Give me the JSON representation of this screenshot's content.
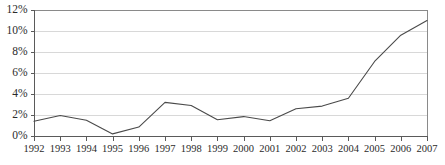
{
  "chart_data": {
    "type": "line",
    "title": "",
    "subtitle": "",
    "xlabel": "",
    "ylabel": "",
    "categories": [
      "1992",
      "1993",
      "1994",
      "1995",
      "1996",
      "1997",
      "1998",
      "1999",
      "2000",
      "2001",
      "2002",
      "2003",
      "2004",
      "2005",
      "2006",
      "2007"
    ],
    "x": [
      1992,
      1993,
      1994,
      1995,
      1996,
      1997,
      1998,
      1999,
      2000,
      2001,
      2002,
      2003,
      2004,
      2005,
      2006,
      2007
    ],
    "values": [
      1.4,
      1.95,
      1.5,
      0.2,
      0.85,
      3.2,
      2.9,
      1.55,
      1.85,
      1.45,
      2.6,
      2.85,
      3.6,
      7.1,
      9.6,
      11.0
    ],
    "series": [
      {
        "name": "",
        "values": [
          1.4,
          1.95,
          1.5,
          0.2,
          0.85,
          3.2,
          2.9,
          1.55,
          1.85,
          1.45,
          2.6,
          2.85,
          3.6,
          7.1,
          9.6,
          11.0
        ]
      }
    ],
    "ylim": [
      0,
      12
    ],
    "xlim": [
      1992,
      2007
    ],
    "ytick_labels": [
      "0%",
      "2%",
      "4%",
      "6%",
      "8%",
      "10%",
      "12%"
    ],
    "ytick_values": [
      0,
      2,
      4,
      6,
      8,
      10,
      12
    ],
    "xtick_labels": [
      "1992",
      "1993",
      "1994",
      "1995",
      "1996",
      "1997",
      "1998",
      "1999",
      "2000",
      "2001",
      "2002",
      "2003",
      "2004",
      "2005",
      "2006",
      "2007"
    ],
    "grid": true,
    "grid_axis": "y",
    "legend": false,
    "legend_position": "none",
    "annotations": [],
    "colors": {
      "series_line": "#4a4a4a",
      "gridline": "#d8d8d8",
      "axis": "#5a5a5a",
      "frame": "#8a8a8a",
      "text": "#2b2b2b",
      "background": "#ffffff"
    }
  },
  "plot_geometry": {
    "left": 34,
    "right": 427,
    "top": 10,
    "bottom": 136
  }
}
